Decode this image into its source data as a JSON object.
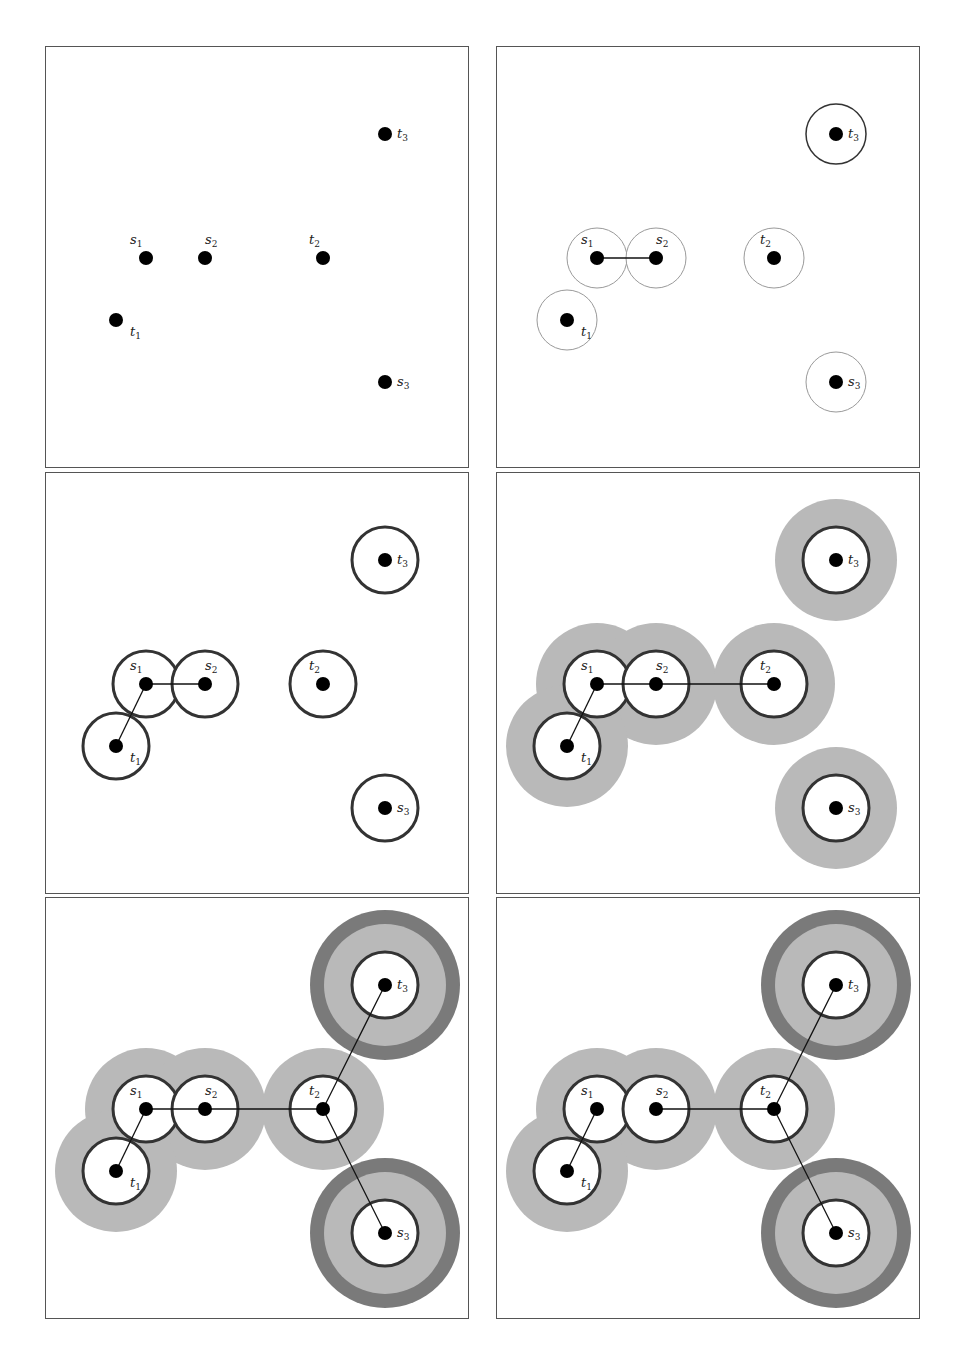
{
  "figure": {
    "points": [
      {
        "id": "s1",
        "name": "s",
        "sub": "1",
        "x": 100,
        "y": 211,
        "label_dx": -16,
        "label_dy": -14
      },
      {
        "id": "s2",
        "name": "s",
        "sub": "2",
        "x": 159,
        "y": 211,
        "label_dx": 0,
        "label_dy": -14
      },
      {
        "id": "t2",
        "name": "t",
        "sub": "2",
        "x": 277,
        "y": 211,
        "label_dx": -14,
        "label_dy": -14
      },
      {
        "id": "t1",
        "name": "t",
        "sub": "1",
        "x": 70,
        "y": 273,
        "label_dx": 14,
        "label_dy": 16
      },
      {
        "id": "t3",
        "name": "t",
        "sub": "3",
        "x": 339,
        "y": 87,
        "label_dx": 12,
        "label_dy": 4
      },
      {
        "id": "s3",
        "name": "s",
        "sub": "3",
        "x": 339,
        "y": 335,
        "label_dx": 12,
        "label_dy": 4
      }
    ],
    "colors": {
      "dot": "#000000",
      "edge": "#111111",
      "thin_ring": "#9a9a9a",
      "thick_ring": "#333333",
      "halo_light": "#b9b9b9",
      "halo_dark": "#7a7a7a",
      "panel_border": "#555555"
    },
    "panels": [
      {
        "id": "p1",
        "left": 45,
        "top": 46,
        "rings": [],
        "halos": [],
        "dark_halos": [],
        "edges": []
      },
      {
        "id": "p2",
        "left": 496,
        "top": 46,
        "rings": [
          {
            "p": "s1",
            "r": 30,
            "style": "thin"
          },
          {
            "p": "s2",
            "r": 30,
            "style": "thin"
          },
          {
            "p": "t2",
            "r": 30,
            "style": "thin"
          },
          {
            "p": "t1",
            "r": 30,
            "style": "thin"
          },
          {
            "p": "s3",
            "r": 30,
            "style": "thin"
          },
          {
            "p": "t3",
            "r": 30,
            "style": "medium"
          }
        ],
        "halos": [],
        "dark_halos": [],
        "edges": [
          [
            "s1",
            "s2"
          ]
        ]
      },
      {
        "id": "p3",
        "left": 45,
        "top": 472,
        "rings": [
          {
            "p": "s1",
            "r": 33,
            "style": "thick"
          },
          {
            "p": "s2",
            "r": 33,
            "style": "thick"
          },
          {
            "p": "t2",
            "r": 33,
            "style": "thick"
          },
          {
            "p": "t1",
            "r": 33,
            "style": "thick"
          },
          {
            "p": "s3",
            "r": 33,
            "style": "thick"
          },
          {
            "p": "t3",
            "r": 33,
            "style": "thick"
          }
        ],
        "halos": [],
        "dark_halos": [],
        "edges": [
          [
            "s1",
            "s2"
          ],
          [
            "s1",
            "t1"
          ]
        ]
      },
      {
        "id": "p4",
        "left": 496,
        "top": 472,
        "rings": [
          {
            "p": "s1",
            "r": 33,
            "style": "thick"
          },
          {
            "p": "s2",
            "r": 33,
            "style": "thick"
          },
          {
            "p": "t2",
            "r": 33,
            "style": "thick"
          },
          {
            "p": "t1",
            "r": 33,
            "style": "thick"
          },
          {
            "p": "s3",
            "r": 33,
            "style": "thick"
          },
          {
            "p": "t3",
            "r": 33,
            "style": "thick"
          }
        ],
        "halos": [
          {
            "p": "s1",
            "r": 61
          },
          {
            "p": "s2",
            "r": 61
          },
          {
            "p": "t2",
            "r": 61
          },
          {
            "p": "t1",
            "r": 61
          },
          {
            "p": "s3",
            "r": 61
          },
          {
            "p": "t3",
            "r": 61
          }
        ],
        "dark_halos": [],
        "edges": [
          [
            "s1",
            "s2"
          ],
          [
            "s2",
            "t2"
          ],
          [
            "s1",
            "t1"
          ]
        ]
      },
      {
        "id": "p5",
        "left": 45,
        "top": 897,
        "rings": [
          {
            "p": "s1",
            "r": 33,
            "style": "thick"
          },
          {
            "p": "s2",
            "r": 33,
            "style": "thick"
          },
          {
            "p": "t2",
            "r": 33,
            "style": "thick"
          },
          {
            "p": "t1",
            "r": 33,
            "style": "thick"
          },
          {
            "p": "s3",
            "r": 33,
            "style": "thick"
          },
          {
            "p": "t3",
            "r": 33,
            "style": "thick"
          }
        ],
        "halos": [
          {
            "p": "s1",
            "r": 61
          },
          {
            "p": "s2",
            "r": 61
          },
          {
            "p": "t2",
            "r": 61
          },
          {
            "p": "t1",
            "r": 61
          },
          {
            "p": "s3",
            "r": 61
          },
          {
            "p": "t3",
            "r": 61
          }
        ],
        "dark_halos": [
          {
            "p": "t3",
            "r": 75
          },
          {
            "p": "s3",
            "r": 75
          }
        ],
        "edges": [
          [
            "s1",
            "s2"
          ],
          [
            "s2",
            "t2"
          ],
          [
            "s1",
            "t1"
          ],
          [
            "t2",
            "t3"
          ],
          [
            "t2",
            "s3"
          ]
        ]
      },
      {
        "id": "p6",
        "left": 496,
        "top": 897,
        "rings": [
          {
            "p": "s1",
            "r": 33,
            "style": "thick"
          },
          {
            "p": "s2",
            "r": 33,
            "style": "thick"
          },
          {
            "p": "t2",
            "r": 33,
            "style": "thick"
          },
          {
            "p": "t1",
            "r": 33,
            "style": "thick"
          },
          {
            "p": "s3",
            "r": 33,
            "style": "thick"
          },
          {
            "p": "t3",
            "r": 33,
            "style": "thick"
          }
        ],
        "halos": [
          {
            "p": "s1",
            "r": 61
          },
          {
            "p": "s2",
            "r": 61
          },
          {
            "p": "t2",
            "r": 61
          },
          {
            "p": "t1",
            "r": 61
          },
          {
            "p": "s3",
            "r": 61
          },
          {
            "p": "t3",
            "r": 61
          }
        ],
        "dark_halos": [
          {
            "p": "t3",
            "r": 75
          },
          {
            "p": "s3",
            "r": 75
          }
        ],
        "edges": [
          [
            "s2",
            "t2"
          ],
          [
            "s1",
            "t1"
          ],
          [
            "t2",
            "t3"
          ],
          [
            "t2",
            "s3"
          ]
        ]
      }
    ]
  }
}
